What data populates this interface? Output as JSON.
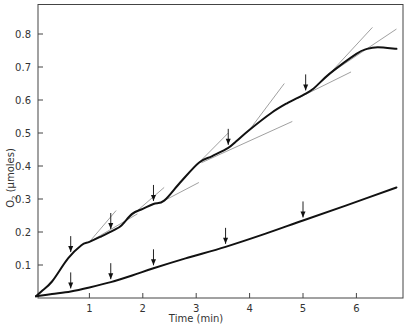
{
  "chart_data": {
    "type": "line",
    "title": "",
    "xlabel": "Time (min)",
    "ylabel": "O2 (µmoles)",
    "ylabel_parts": {
      "base": "O",
      "sub": "2",
      "rest": " (µmoles)"
    },
    "xlim": [
      0,
      6.9
    ],
    "ylim": [
      0,
      0.88
    ],
    "x_ticks": [
      1,
      2,
      3,
      4,
      5,
      6
    ],
    "x_tick_labels": [
      "1",
      "2",
      "3",
      "4",
      "5",
      "6"
    ],
    "y_ticks": [
      0.1,
      0.2,
      0.3,
      0.4,
      0.5,
      0.6,
      0.7,
      0.8
    ],
    "y_tick_labels": [
      "0.1",
      "0.2",
      "0.3",
      "0.4",
      "0.5",
      "0.6",
      "0.7",
      "0.8"
    ],
    "grid": false,
    "legend": null,
    "series": [
      {
        "name": "upper curve (stepwise)",
        "x": [
          0.0,
          0.1,
          0.3,
          0.6,
          0.85,
          1.0,
          1.2,
          1.45,
          1.6,
          1.8,
          2.0,
          2.2,
          2.4,
          2.7,
          3.05,
          3.3,
          3.6,
          3.75,
          4.0,
          4.4,
          4.7,
          5.0,
          5.2,
          5.5,
          6.0,
          6.2,
          6.4,
          6.75
        ],
        "y": [
          0.005,
          0.02,
          0.05,
          0.12,
          0.16,
          0.17,
          0.185,
          0.205,
          0.22,
          0.255,
          0.27,
          0.285,
          0.295,
          0.35,
          0.41,
          0.43,
          0.455,
          0.475,
          0.51,
          0.56,
          0.59,
          0.615,
          0.635,
          0.68,
          0.74,
          0.755,
          0.76,
          0.755
        ]
      },
      {
        "name": "lower curve",
        "x": [
          0.0,
          0.3,
          0.65,
          1.0,
          1.4,
          1.8,
          2.2,
          2.8,
          3.55,
          4.3,
          5.0,
          5.8,
          6.75
        ],
        "y": [
          0.005,
          0.012,
          0.02,
          0.032,
          0.048,
          0.068,
          0.09,
          0.12,
          0.155,
          0.195,
          0.235,
          0.28,
          0.335
        ]
      }
    ],
    "annotations": {
      "arrows_upper": [
        {
          "x": 0.65,
          "y": 0.13
        },
        {
          "x": 1.4,
          "y": 0.2
        },
        {
          "x": 2.2,
          "y": 0.285
        },
        {
          "x": 3.6,
          "y": 0.455
        },
        {
          "x": 5.05,
          "y": 0.62
        }
      ],
      "arrows_lower": [
        {
          "x": 0.65,
          "y": 0.02
        },
        {
          "x": 1.4,
          "y": 0.048
        },
        {
          "x": 2.2,
          "y": 0.09
        },
        {
          "x": 3.55,
          "y": 0.155
        },
        {
          "x": 5.0,
          "y": 0.235
        }
      ],
      "tangent_lines": [
        {
          "x1": 1.0,
          "y1": 0.17,
          "x2": 1.5,
          "y2": 0.265
        },
        {
          "x1": 1.0,
          "y1": 0.17,
          "x2": 1.9,
          "y2": 0.255
        },
        {
          "x1": 1.65,
          "y1": 0.23,
          "x2": 2.4,
          "y2": 0.335
        },
        {
          "x1": 2.4,
          "y1": 0.295,
          "x2": 3.05,
          "y2": 0.35
        },
        {
          "x1": 3.05,
          "y1": 0.41,
          "x2": 3.6,
          "y2": 0.5
        },
        {
          "x1": 3.1,
          "y1": 0.41,
          "x2": 4.8,
          "y2": 0.535
        },
        {
          "x1": 4.0,
          "y1": 0.51,
          "x2": 4.65,
          "y2": 0.65
        },
        {
          "x1": 4.9,
          "y1": 0.605,
          "x2": 5.9,
          "y2": 0.685
        },
        {
          "x1": 5.5,
          "y1": 0.68,
          "x2": 6.3,
          "y2": 0.82
        },
        {
          "x1": 5.5,
          "y1": 0.68,
          "x2": 6.75,
          "y2": 0.815
        }
      ]
    }
  }
}
